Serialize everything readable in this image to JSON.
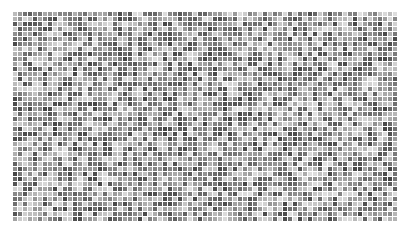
{
  "mosaic": {
    "columns": 77,
    "rows": 42,
    "cell_size_px": 4,
    "gap_px": 1,
    "origin": [
      13,
      12
    ],
    "gap_color": "#ffffff",
    "gray_range": [
      70,
      225
    ],
    "seed": 1337
  }
}
